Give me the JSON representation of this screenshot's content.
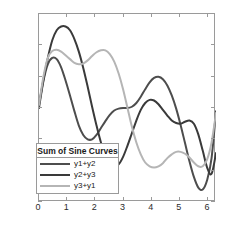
{
  "chart_data": {
    "type": "line",
    "title": "",
    "xlabel": "",
    "ylabel": "",
    "xlim": [
      0,
      6.2832
    ],
    "ylim": [
      -1.5,
      1.5
    ],
    "grid": false,
    "legend_position": "lower-left-inside",
    "legend_title": "Sum of Sine Curves",
    "xticks": [
      0,
      1,
      2,
      3,
      4,
      5,
      6
    ],
    "xtick_labels": [
      "0",
      "1",
      "2",
      "3",
      "4",
      "5",
      "6"
    ],
    "yticks": [
      1.5,
      1,
      0.5,
      0,
      -0.5,
      -1,
      -1.5
    ],
    "ytick_labels": [
      "1.5",
      "1",
      "0.5",
      "0",
      "-0.5",
      "-1",
      "-1.5"
    ],
    "series": [
      {
        "name": "y1+y2",
        "color": "#4d4d4d",
        "x": [
          0,
          0.1571,
          0.3142,
          0.4712,
          0.6283,
          0.7854,
          0.9425,
          1.0996,
          1.2566,
          1.4137,
          1.5708,
          1.7279,
          1.885,
          2.042,
          2.1991,
          2.3562,
          2.5133,
          2.6704,
          2.8274,
          2.9845,
          3.1416,
          3.2987,
          3.4558,
          3.6128,
          3.7699,
          3.927,
          4.0841,
          4.2412,
          4.3982,
          4.5553,
          4.7124,
          4.8695,
          5.0265,
          5.1836,
          5.3407,
          5.4978,
          5.6549,
          5.8119,
          5.969,
          6.1261,
          6.2832
        ],
        "y": [
          0,
          0.43,
          0.7,
          0.8,
          0.78,
          0.65,
          0.44,
          0.2,
          -0.05,
          -0.28,
          -0.43,
          -0.5,
          -0.5,
          -0.43,
          -0.32,
          -0.21,
          -0.11,
          -0.04,
          -0.01,
          0,
          0,
          0.02,
          0.08,
          0.18,
          0.3,
          0.41,
          0.48,
          0.5,
          0.46,
          0.36,
          0.2,
          -0.01,
          -0.27,
          -0.56,
          -0.85,
          -1.1,
          -1.27,
          -1.3,
          -1.15,
          -0.8,
          -0.05
        ]
      },
      {
        "name": "y2+y3",
        "color": "#3a3a3a",
        "x": [
          0,
          0.1571,
          0.3142,
          0.4712,
          0.6283,
          0.7854,
          0.9425,
          1.0996,
          1.2566,
          1.4137,
          1.5708,
          1.7279,
          1.885,
          2.042,
          2.1991,
          2.3562,
          2.5133,
          2.6704,
          2.8274,
          2.9845,
          3.1416,
          3.2987,
          3.4558,
          3.6128,
          3.7699,
          3.927,
          4.0841,
          4.2412,
          4.3982,
          4.5553,
          4.7124,
          4.8695,
          5.0265,
          5.1836,
          5.3407,
          5.4978,
          5.6549,
          5.8119,
          5.969,
          6.1261,
          6.2832
        ],
        "y": [
          0.05,
          0.45,
          0.8,
          1.08,
          1.24,
          1.3,
          1.3,
          1.24,
          1.1,
          0.9,
          0.64,
          0.34,
          0.02,
          -0.28,
          -0.55,
          -0.75,
          -0.88,
          -0.93,
          -0.9,
          -0.78,
          -0.6,
          -0.4,
          -0.2,
          -0.03,
          0.08,
          0.13,
          0.12,
          0.06,
          -0.03,
          -0.12,
          -0.2,
          -0.24,
          -0.25,
          -0.22,
          -0.2,
          -0.25,
          -0.42,
          -0.68,
          -0.95,
          -1.05,
          -0.72
        ]
      },
      {
        "name": "y3+y1",
        "color": "#b5b5b5",
        "x": [
          0,
          0.1571,
          0.3142,
          0.4712,
          0.6283,
          0.7854,
          0.9425,
          1.0996,
          1.2566,
          1.4137,
          1.5708,
          1.7279,
          1.885,
          2.042,
          2.1991,
          2.3562,
          2.5133,
          2.6704,
          2.8274,
          2.9845,
          3.1416,
          3.2987,
          3.4558,
          3.6128,
          3.7699,
          3.927,
          4.0841,
          4.2412,
          4.3982,
          4.5553,
          4.7124,
          4.8695,
          5.0265,
          5.1836,
          5.3407,
          5.4978,
          5.6549,
          5.8119,
          5.969,
          6.1261,
          6.2832
        ],
        "y": [
          0.05,
          0.5,
          0.8,
          0.91,
          0.93,
          0.9,
          0.84,
          0.78,
          0.72,
          0.7,
          0.71,
          0.76,
          0.83,
          0.89,
          0.92,
          0.92,
          0.86,
          0.74,
          0.55,
          0.3,
          0.0,
          -0.3,
          -0.55,
          -0.74,
          -0.87,
          -0.93,
          -0.95,
          -0.93,
          -0.88,
          -0.8,
          -0.74,
          -0.7,
          -0.7,
          -0.73,
          -0.79,
          -0.87,
          -0.93,
          -0.93,
          -0.82,
          -0.55,
          -0.08
        ]
      }
    ]
  },
  "legend": {
    "title": "Sum of Sine Curves",
    "entries": [
      {
        "label": "y1+y2",
        "color": "#4d4d4d"
      },
      {
        "label": "y2+y3",
        "color": "#3a3a3a"
      },
      {
        "label": "y3+y1",
        "color": "#b5b5b5"
      }
    ]
  },
  "axes": {
    "border_color": "#9a9a9a",
    "tick_label_color": "#2b2b2b"
  }
}
